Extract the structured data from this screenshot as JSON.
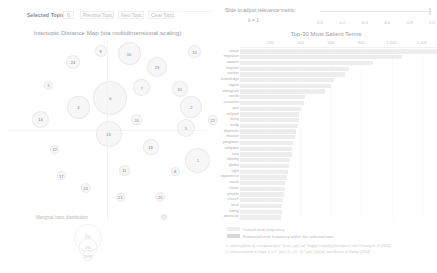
{
  "toolbar": {
    "selected_topic_label": "Selected Topic:",
    "selected_topic_value": "0",
    "previous_topic_label": "Previous Topic",
    "next_topic_label": "Next Topic",
    "clear_topic_label": "Clear Topic"
  },
  "slider": {
    "label": "Slide to adjust relevance metric:",
    "lambda_text": "λ = 1",
    "value": 1,
    "ticks": [
      "0.0",
      "0.2",
      "0.4",
      "0.6",
      "0.8",
      "1.0"
    ]
  },
  "left_panel": {
    "title": "Intertopic Distance Map (via multidimensional scaling)",
    "legend_title": "Marginal topic distribution",
    "size_legend": [
      "2%",
      "5%",
      "10%"
    ]
  },
  "right_panel": {
    "title": "Top-30 Most Salient Terms",
    "legend_overall": "Overall term frequency",
    "legend_estimated": "Estimated term frequency within the selected topic",
    "footnote_1": "1. saliency(term w) = frequency(w) * [sum_t p(t | w) * log(p(t | w)/p(t))] for topics t; see Chuang et. al (2012)",
    "footnote_2": "2. relevance(term w | topic t) = λ * p(w | t) + (1 - λ) * p(w | t)/p(w); see Sievert & Shirley (2014)"
  },
  "chart_data": {
    "type": "bar",
    "title": "Top-30 Most Salient Terms",
    "xlabel": "",
    "ylabel": "",
    "xlim": [
      0,
      1300
    ],
    "grid": true,
    "legend_position": "bottom",
    "xticks": [
      200,
      400,
      600,
      800,
      1000,
      1200
    ],
    "xtick_labels": [
      "200",
      "400",
      "600",
      "800",
      "1,000",
      "1,200"
    ],
    "categories": [
      "vision",
      "migration",
      "women",
      "migrant",
      "worker",
      "knowledge",
      "region",
      "immigrant",
      "needs",
      "countries",
      "part",
      "religion",
      "living",
      "study",
      "domestic",
      "mission",
      "programs",
      "religious",
      "new",
      "identity",
      "global",
      "right",
      "experience",
      "social",
      "states",
      "people",
      "church",
      "local",
      "family",
      "american"
    ],
    "values": [
      1300,
      1070,
      880,
      720,
      690,
      620,
      600,
      560,
      430,
      420,
      400,
      390,
      390,
      380,
      370,
      360,
      350,
      345,
      340,
      330,
      325,
      320,
      310,
      300,
      295,
      290,
      285,
      280,
      275,
      270
    ],
    "series": [
      {
        "name": "Overall term frequency",
        "values": [
          1300,
          1070,
          880,
          720,
          690,
          620,
          600,
          560,
          430,
          420,
          400,
          390,
          390,
          380,
          370,
          360,
          350,
          345,
          340,
          330,
          325,
          320,
          310,
          300,
          295,
          290,
          285,
          280,
          275,
          270
        ]
      },
      {
        "name": "Estimated term frequency within the selected topic",
        "values": [
          0,
          0,
          0,
          0,
          0,
          0,
          0,
          0,
          0,
          0,
          0,
          0,
          0,
          0,
          0,
          0,
          0,
          0,
          0,
          0,
          0,
          0,
          0,
          0,
          0,
          0,
          0,
          0,
          0,
          0
        ]
      }
    ]
  },
  "topics": [
    {
      "id": "15",
      "x": 0.905,
      "y": 0.075,
      "r": 6.5
    },
    {
      "id": "16",
      "x": 0.6,
      "y": 0.085,
      "r": 11.5
    },
    {
      "id": "9",
      "x": 0.468,
      "y": 0.068,
      "r": 6.0
    },
    {
      "id": "24",
      "x": 0.34,
      "y": 0.128,
      "r": 7.0
    },
    {
      "id": "19",
      "x": 0.73,
      "y": 0.155,
      "r": 10.0
    },
    {
      "id": "10",
      "x": 0.835,
      "y": 0.275,
      "r": 8.0
    },
    {
      "id": "3",
      "x": 0.225,
      "y": 0.255,
      "r": 4.5
    },
    {
      "id": "7",
      "x": 0.66,
      "y": 0.27,
      "r": 8.5
    },
    {
      "id": "6",
      "x": 0.513,
      "y": 0.325,
      "r": 17.0
    },
    {
      "id": "4",
      "x": 0.365,
      "y": 0.375,
      "r": 11.5
    },
    {
      "id": "2",
      "x": 0.89,
      "y": 0.375,
      "r": 11.0
    },
    {
      "id": "14",
      "x": 0.188,
      "y": 0.44,
      "r": 8.5
    },
    {
      "id": "20",
      "x": 0.635,
      "y": 0.443,
      "r": 5.5
    },
    {
      "id": "22",
      "x": 0.99,
      "y": 0.443,
      "r": 5.0
    },
    {
      "id": "5",
      "x": 0.865,
      "y": 0.487,
      "r": 9.0
    },
    {
      "id": "13",
      "x": 0.505,
      "y": 0.52,
      "r": 13.0
    },
    {
      "id": "18",
      "x": 0.7,
      "y": 0.59,
      "r": 8.0
    },
    {
      "id": "12",
      "x": 0.255,
      "y": 0.6,
      "r": 4.5
    },
    {
      "id": "1",
      "x": 0.92,
      "y": 0.66,
      "r": 12.5
    },
    {
      "id": "11",
      "x": 0.578,
      "y": 0.715,
      "r": 5.5
    },
    {
      "id": "8",
      "x": 0.815,
      "y": 0.72,
      "r": 4.5
    },
    {
      "id": "17",
      "x": 0.285,
      "y": 0.745,
      "r": 4.5
    },
    {
      "id": "23",
      "x": 0.398,
      "y": 0.812,
      "r": 5.0
    },
    {
      "id": "21",
      "x": 0.56,
      "y": 0.862,
      "r": 4.5
    },
    {
      "id": "25",
      "x": 0.745,
      "y": 0.862,
      "r": 5.0
    }
  ]
}
